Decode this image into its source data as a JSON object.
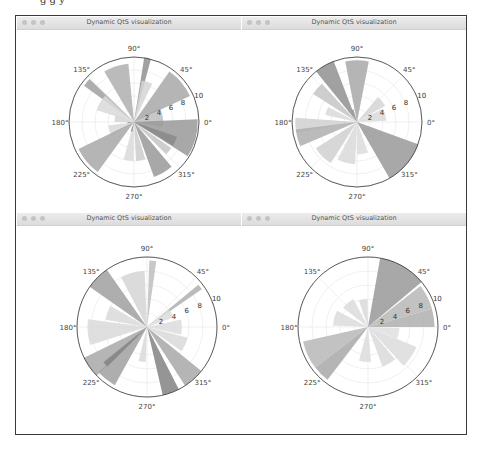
{
  "caption_fragment": "g  g   y",
  "windows": [
    {
      "title": "Dynamic QtS visualization",
      "x": 17,
      "y": 17,
      "w": 224,
      "h": 196
    },
    {
      "title": "Dynamic QtS visualization",
      "x": 242,
      "y": 17,
      "w": 224,
      "h": 196
    },
    {
      "title": "Dynamic QtS visualization",
      "x": 17,
      "y": 213,
      "w": 224,
      "h": 220
    },
    {
      "title": "Dynamic QtS visualization",
      "x": 242,
      "y": 213,
      "w": 224,
      "h": 220
    }
  ],
  "chart_data": [
    {
      "type": "bar",
      "subtype": "polar",
      "title": "Dynamic QtS visualization",
      "center": [
        134,
        122
      ],
      "radius": 65,
      "rmax": 10,
      "angle_labels": [
        "0°",
        "45°",
        "90°",
        "135°",
        "180°",
        "225°",
        "270°",
        "315°"
      ],
      "radial_ticks": [
        2,
        4,
        6,
        8,
        10
      ],
      "radial_label_angle": 22.5,
      "bars": [
        {
          "theta": 10,
          "width": 40,
          "r": 4.5,
          "shade": 0.3
        },
        {
          "theta": 40,
          "width": 30,
          "r": 9.5,
          "shade": 0.45
        },
        {
          "theta": 78,
          "width": 6,
          "r": 10,
          "shade": 0.6
        },
        {
          "theta": 72,
          "width": 15,
          "r": 6.5,
          "shade": 0.15
        },
        {
          "theta": 108,
          "width": 25,
          "r": 9,
          "shade": 0.4
        },
        {
          "theta": 140,
          "width": 8,
          "r": 9.5,
          "shade": 0.5
        },
        {
          "theta": 150,
          "width": 25,
          "r": 6,
          "shade": 0.12
        },
        {
          "theta": 170,
          "width": 20,
          "r": 3,
          "shade": 0.15
        },
        {
          "theta": 200,
          "width": 25,
          "r": 4,
          "shade": 0.12
        },
        {
          "theta": 220,
          "width": 28,
          "r": 9.5,
          "shade": 0.45
        },
        {
          "theta": 262,
          "width": 15,
          "r": 6,
          "shade": 0.12
        },
        {
          "theta": 280,
          "width": 14,
          "r": 6,
          "shade": 0.2
        },
        {
          "theta": 300,
          "width": 20,
          "r": 9,
          "shade": 0.55
        },
        {
          "theta": 320,
          "width": 10,
          "r": 7,
          "shade": 0.25
        },
        {
          "theta": 345,
          "width": 35,
          "r": 9.8,
          "shade": 0.55
        },
        {
          "theta": 335,
          "width": 12,
          "r": 7,
          "shade": 0.65
        },
        {
          "theta": 185,
          "width": 10,
          "r": 1,
          "shade": 0.6
        },
        {
          "theta": 255,
          "width": 10,
          "r": 1.5,
          "shade": 0.7
        }
      ]
    },
    {
      "type": "bar",
      "subtype": "polar",
      "title": "Dynamic QtS visualization",
      "center": [
        357,
        122
      ],
      "radius": 65,
      "rmax": 10,
      "angle_labels": [
        "0°",
        "45°",
        "90°",
        "135°",
        "180°",
        "225°",
        "270°",
        "315°"
      ],
      "radial_ticks": [
        2,
        4,
        6,
        8,
        10
      ],
      "radial_label_angle": 22.5,
      "bars": [
        {
          "theta": 15,
          "width": 25,
          "r": 4.5,
          "shade": 0.12
        },
        {
          "theta": 40,
          "width": 20,
          "r": 5,
          "shade": 0.15
        },
        {
          "theta": 90,
          "width": 22,
          "r": 9.5,
          "shade": 0.45
        },
        {
          "theta": 120,
          "width": 18,
          "r": 10,
          "shade": 0.6
        },
        {
          "theta": 140,
          "width": 15,
          "r": 8,
          "shade": 0.25
        },
        {
          "theta": 160,
          "width": 15,
          "r": 5,
          "shade": 0.12
        },
        {
          "theta": 183,
          "width": 14,
          "r": 9.5,
          "shade": 0.18
        },
        {
          "theta": 195,
          "width": 16,
          "r": 9.5,
          "shade": 0.4
        },
        {
          "theta": 225,
          "width": 25,
          "r": 7.5,
          "shade": 0.18
        },
        {
          "theta": 255,
          "width": 25,
          "r": 6.5,
          "shade": 0.12
        },
        {
          "theta": 280,
          "width": 20,
          "r": 5,
          "shade": 0.1
        },
        {
          "theta": 320,
          "width": 40,
          "r": 10,
          "shade": 0.55
        },
        {
          "theta": 110,
          "width": 8,
          "r": 2,
          "shade": 0.6
        }
      ]
    },
    {
      "type": "bar",
      "subtype": "polar",
      "title": "Dynamic QtS visualization",
      "center": [
        147,
        327
      ],
      "radius": 70,
      "rmax": 10,
      "angle_labels": [
        "0°",
        "45°",
        "90°",
        "135°",
        "180°",
        "225°",
        "270°",
        "315°"
      ],
      "radial_ticks": [
        2,
        4,
        6,
        8,
        10
      ],
      "radial_label_angle": 22.5,
      "bars": [
        {
          "theta": 0,
          "width": 25,
          "r": 5,
          "shade": 0.1
        },
        {
          "theta": 37,
          "width": 5,
          "r": 9.5,
          "shade": 0.4
        },
        {
          "theta": 30,
          "width": 20,
          "r": 4,
          "shade": 0.1
        },
        {
          "theta": 85,
          "width": 6,
          "r": 9.5,
          "shade": 0.3
        },
        {
          "theta": 105,
          "width": 25,
          "r": 8,
          "shade": 0.15
        },
        {
          "theta": 135,
          "width": 20,
          "r": 10,
          "shade": 0.5
        },
        {
          "theta": 160,
          "width": 20,
          "r": 6,
          "shade": 0.12
        },
        {
          "theta": 185,
          "width": 25,
          "r": 8.5,
          "shade": 0.12
        },
        {
          "theta": 215,
          "width": 18,
          "r": 10,
          "shade": 0.45
        },
        {
          "theta": 232,
          "width": 18,
          "r": 9.5,
          "shade": 0.5
        },
        {
          "theta": 222,
          "width": 6,
          "r": 8,
          "shade": 0.7
        },
        {
          "theta": 262,
          "width": 12,
          "r": 5,
          "shade": 0.12
        },
        {
          "theta": 290,
          "width": 14,
          "r": 10,
          "shade": 0.7
        },
        {
          "theta": 312,
          "width": 18,
          "r": 10,
          "shade": 0.45
        },
        {
          "theta": 335,
          "width": 20,
          "r": 6,
          "shade": 0.12
        }
      ]
    },
    {
      "type": "bar",
      "subtype": "polar",
      "title": "Dynamic QtS visualization",
      "center": [
        368,
        327
      ],
      "radius": 70,
      "rmax": 10,
      "angle_labels": [
        "0°",
        "45°",
        "90°",
        "135°",
        "180°",
        "225°",
        "270°",
        "315°"
      ],
      "radial_ticks": [
        2,
        4,
        6,
        8,
        10
      ],
      "radial_label_angle": 22.5,
      "bars": [
        {
          "theta": 8,
          "width": 16,
          "r": 9.5,
          "shade": 0.4
        },
        {
          "theta": 27,
          "width": 22,
          "r": 9.5,
          "shade": 0.35
        },
        {
          "theta": 60,
          "width": 40,
          "r": 10,
          "shade": 0.55
        },
        {
          "theta": 100,
          "width": 18,
          "r": 4,
          "shade": 0.12
        },
        {
          "theta": 130,
          "width": 25,
          "r": 4.5,
          "shade": 0.1
        },
        {
          "theta": 165,
          "width": 25,
          "r": 5,
          "shade": 0.1
        },
        {
          "theta": 205,
          "width": 25,
          "r": 9.5,
          "shade": 0.35
        },
        {
          "theta": 225,
          "width": 15,
          "r": 9.5,
          "shade": 0.45
        },
        {
          "theta": 265,
          "width": 20,
          "r": 5,
          "shade": 0.1
        },
        {
          "theta": 300,
          "width": 20,
          "r": 6,
          "shade": 0.12
        },
        {
          "theta": 325,
          "width": 25,
          "r": 7.5,
          "shade": 0.1
        },
        {
          "theta": 348,
          "width": 20,
          "r": 4.5,
          "shade": 0.08
        }
      ]
    }
  ]
}
